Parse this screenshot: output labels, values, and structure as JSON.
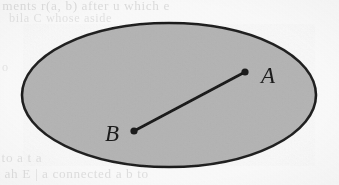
{
  "figure": {
    "caption": "",
    "background_color": "#fbfbfb",
    "region": {
      "name": "convex-set-ellipse",
      "shape": "ellipse",
      "fill_color": "#b5b5b5",
      "stroke_color": "#1f1f1f",
      "stroke_width": 2.6,
      "center_x": 169,
      "center_y": 95,
      "radius_x": 147,
      "radius_y": 72
    },
    "segment": {
      "name": "segment-AB",
      "stroke_color": "#1a1a1a",
      "stroke_width": 2.6,
      "endpoint_radius": 3.6,
      "from": {
        "label": "B",
        "x": 134,
        "y": 131
      },
      "to": {
        "label": "A",
        "x": 245,
        "y": 72
      }
    },
    "points": [
      {
        "label": "A",
        "x": 245,
        "y": 72,
        "label_x": 268,
        "label_y": 83
      },
      {
        "label": "B",
        "x": 134,
        "y": 131,
        "label_x": 112,
        "label_y": 141
      }
    ]
  },
  "ghost_text": {
    "top_line_1": "ments r(a, b) after u which e",
    "top_line_2": "bila C whose aside",
    "middle_left": "o",
    "middle_right": "a",
    "bottom_line_1": "to a t a",
    "bottom_line_2": "ah  E  |  a   connected  a  b  to"
  }
}
